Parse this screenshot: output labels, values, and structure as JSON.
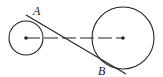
{
  "diagram": {
    "labels": {
      "a": "A",
      "b": "B"
    },
    "small_circle": {
      "cx": 26,
      "cy": 38,
      "r": 17
    },
    "large_circle": {
      "cx": 123,
      "cy": 38,
      "r": 31
    },
    "colors": {
      "stroke": "#222222",
      "background": "#ffffff"
    }
  }
}
